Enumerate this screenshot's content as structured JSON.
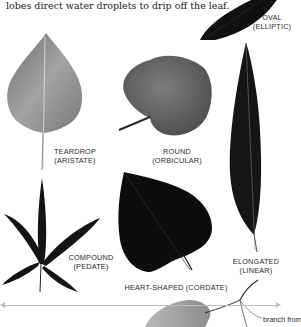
{
  "intro_text": "lobes direct water droplets to drip off the leaf.",
  "leaves": [
    {
      "id": "oval",
      "line1": "OVAL",
      "line2": "(ELLIPTIC)"
    },
    {
      "id": "teardrop",
      "line1": "TEARDROP",
      "line2": "(ARISTATE)"
    },
    {
      "id": "round",
      "line1": "ROUND",
      "line2": "(ORBICULAR)"
    },
    {
      "id": "elongated",
      "line1": "ELONGATED",
      "line2": "(LINEAR)"
    },
    {
      "id": "compound",
      "line1": "COMPOUND",
      "line2": "(PEDATE)"
    },
    {
      "id": "heart",
      "line1": "HEART-SHAPED (CORDATE)",
      "line2": ""
    }
  ],
  "annotation": {
    "branch_label": "branch from"
  },
  "colors": {
    "background": "#ffffff",
    "text": "#2a2a2a",
    "rule": "#bdbdbd",
    "dark_leaf": "#111111",
    "gray_leaf": "#8a8a8a"
  }
}
